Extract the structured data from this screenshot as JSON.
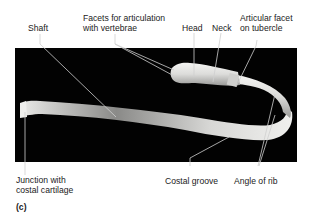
{
  "figure": {
    "letter": "(c)",
    "labels": {
      "shaft": "Shaft",
      "facets_line1": "Facets for articulation",
      "facets_line2": "with vertebrae",
      "head": "Head",
      "neck": "Neck",
      "articular_facet_line1": "Articular facet",
      "articular_facet_line2": "on tubercle",
      "junction_line1": "Junction with",
      "junction_line2": "costal cartilage",
      "costal_groove": "Costal groove",
      "angle_of_rib": "Angle of rib"
    }
  }
}
